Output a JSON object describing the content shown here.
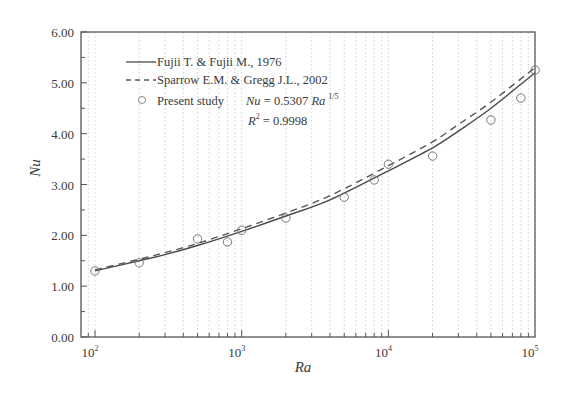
{
  "chart_data": {
    "type": "line",
    "title": "",
    "xlabel": "Ra",
    "ylabel": "Nu",
    "xscale": "log",
    "xlim": [
      100,
      100000
    ],
    "ylim": [
      0,
      6
    ],
    "x_tick_labels": [
      "10^2",
      "10^3",
      "10^4",
      "10^5"
    ],
    "x_ticks": [
      100,
      1000,
      10000,
      100000
    ],
    "y_tick_labels": [
      "0.00",
      "1.00",
      "2.00",
      "3.00",
      "4.00",
      "5.00",
      "6.00"
    ],
    "y_ticks": [
      0,
      1,
      2,
      3,
      4,
      5,
      6
    ],
    "grid": "dotted vertical minor gridlines",
    "legend_position": "upper left",
    "series": [
      {
        "name": "Fujii T. & Fujii M., 1976",
        "style": "solid line",
        "x": [
          100,
          200,
          300,
          500,
          1000,
          2000,
          4000,
          10000,
          20000,
          30000,
          50000,
          100000
        ],
        "y": [
          1.3,
          1.5,
          1.62,
          1.8,
          2.08,
          2.38,
          2.7,
          3.27,
          3.72,
          4.05,
          4.5,
          5.2
        ]
      },
      {
        "name": "Sparrow E.M. & Gregg J.L., 2002",
        "style": "dashed line",
        "x": [
          100,
          200,
          300,
          500,
          1000,
          2000,
          4000,
          10000,
          20000,
          30000,
          50000,
          100000
        ],
        "y": [
          1.32,
          1.53,
          1.66,
          1.84,
          2.13,
          2.44,
          2.78,
          3.37,
          3.84,
          4.18,
          4.62,
          5.3
        ]
      },
      {
        "name": "Present study",
        "style": "open circle markers",
        "x": [
          100,
          200,
          500,
          800,
          1000,
          2000,
          5000,
          8000,
          10000,
          20000,
          50000,
          80000,
          100000
        ],
        "y": [
          1.3,
          1.46,
          1.93,
          1.87,
          2.1,
          2.34,
          2.75,
          3.09,
          3.4,
          3.56,
          4.27,
          4.7,
          5.25
        ]
      }
    ],
    "annotations": [
      "Nu = 0.5307 Ra^(1/5)",
      "R^2 = 0.9998"
    ]
  },
  "legend": {
    "fujii": "Fujii T. & Fujii M., 1976",
    "sparrow": "Sparrow E.M. & Gregg J.L., 2002",
    "present": "Present study",
    "eq_nu": "Nu",
    "eq_mid": " = 0.5307 ",
    "eq_ra": "Ra",
    "eq_exp": "1/5",
    "r2_r": "R",
    "r2_sup": "2",
    "r2_val": " = 0.9998"
  },
  "axes": {
    "xlabel": "Ra",
    "ylabel": "Nu",
    "x_base": "10",
    "x_exps": [
      "2",
      "3",
      "4",
      "5"
    ],
    "y_labels": [
      "0.00",
      "1.00",
      "2.00",
      "3.00",
      "4.00",
      "5.00",
      "6.00"
    ]
  },
  "colors": {
    "line": "#4a4a4a",
    "frame": "#555555",
    "grid": "#c8c8c8",
    "marker": "#777777"
  }
}
